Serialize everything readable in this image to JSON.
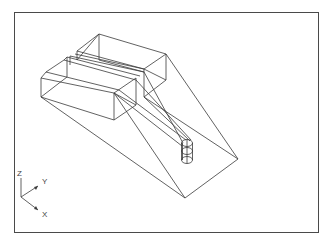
{
  "drawing": {
    "type": "3d-wireframe",
    "description": "Isometric wireframe of a stepped block with ramped planes converging on a vertical cylinder",
    "line_color": "#3a3a3a",
    "background_color": "#ffffff",
    "frame_color": "#4a4a4a"
  },
  "ucs_icon": {
    "z_label": "Z",
    "y_label": "Y",
    "x_label": "X"
  }
}
